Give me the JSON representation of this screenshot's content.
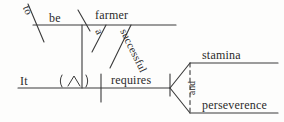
{
  "diagram": {
    "type": "reed-kellogg-sentence-diagram",
    "sentence": "It requires a successful farmer to be stamina and perseverence",
    "ink_color": "#3a3a3a",
    "background_color": "#fdfdfc",
    "labels": {
      "subject": "It",
      "ellipsis_symbol": "( ∧ )",
      "verb": "requires",
      "infinitive_particle": "to",
      "infinitive_verb": "be",
      "predicate_noun": "farmer",
      "article_modifier": "a",
      "adjective_modifier": "successful",
      "conjunction": "and",
      "object_first": "stamina",
      "object_second": "perseverence"
    }
  }
}
